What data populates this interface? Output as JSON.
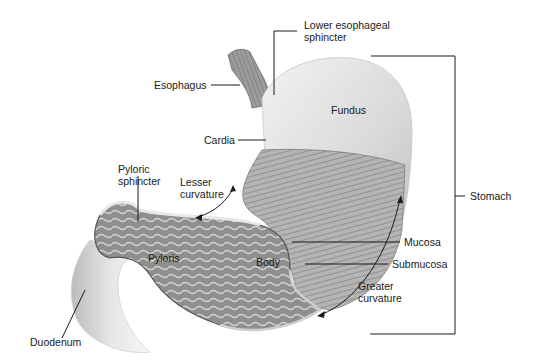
{
  "figure": {
    "labels": {
      "lower_esophageal_sphincter": "Lower esophageal\nsphincter",
      "esophagus": "Esophagus",
      "fundus": "Fundus",
      "cardia": "Cardia",
      "pyloric_sphincter": "Pyloric\nsphincter",
      "lesser_curvature": "Lesser\ncurvature",
      "stomach": "Stomach",
      "pyloris": "Pyloris",
      "body": "Body",
      "mucosa": "Mucosa",
      "submucosa": "Submucosa",
      "greater_curvature": "Greater\ncurvature",
      "duodenum": "Duodenum"
    },
    "colors": {
      "background": "#ffffff",
      "outer_wall": "#dcdcdc",
      "muscle_band": "#a8a8a8",
      "interior": "#8a8a8a",
      "leader_line": "#1a1a1a"
    }
  }
}
